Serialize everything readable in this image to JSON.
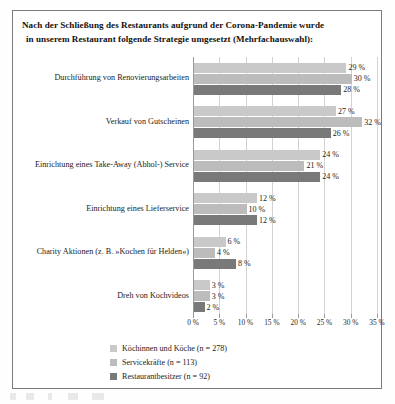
{
  "title": {
    "line1": "Nach der Schließung des Restaurants aufgrund der Corona-Pandemie wurde",
    "line2": "in unserem Restaurant folgende Strategie umgesetzt (Mehrfachauswahl):"
  },
  "chart_data": {
    "type": "bar",
    "orientation": "horizontal",
    "title": "Nach der Schließung des Restaurants aufgrund der Corona-Pandemie wurde in unserem Restaurant folgende Strategie umgesetzt (Mehrfachauswahl):",
    "xlabel": "",
    "ylabel": "",
    "xlim": [
      0,
      35
    ],
    "xticks": [
      "0 %",
      "5 %",
      "10 %",
      "15 %",
      "20 %",
      "25 %",
      "30 %",
      "35 %"
    ],
    "xtick_values": [
      0,
      5,
      10,
      15,
      20,
      25,
      30,
      35
    ],
    "grid": true,
    "legend_position": "bottom",
    "categories": [
      "Durchführung von Renovierungsarbeiten",
      "Verkauf von Gutscheinen",
      "Einrichtung eines Take-Away (Abhol-) Service",
      "Einrichtung eines Lieferservice",
      "Charity Aktionen (z. B. »Kochen für Helden«)",
      "Dreh von Kochvideos"
    ],
    "series": [
      {
        "name": "Köchinnen und Köche (n = 278)",
        "color": "#c9c9c9",
        "values": [
          29,
          27,
          24,
          12,
          6,
          3
        ],
        "labels": [
          "29 %",
          "27 %",
          "24 %",
          "12 %",
          "6 %",
          "3 %"
        ]
      },
      {
        "name": "Servicekräfte (n = 113)",
        "color": "#bcbcbc",
        "values": [
          30,
          32,
          21,
          10,
          4,
          3
        ],
        "labels": [
          "30 %",
          "32 %",
          "21 %",
          "10 %",
          "4 %",
          "3 %"
        ]
      },
      {
        "name": "Restaurantbesitzer (n = 92)",
        "color": "#797979",
        "values": [
          28,
          26,
          24,
          12,
          8,
          2
        ],
        "labels": [
          "28 %",
          "26 %",
          "24 %",
          "12 %",
          "8 %",
          "2 %"
        ]
      }
    ]
  }
}
